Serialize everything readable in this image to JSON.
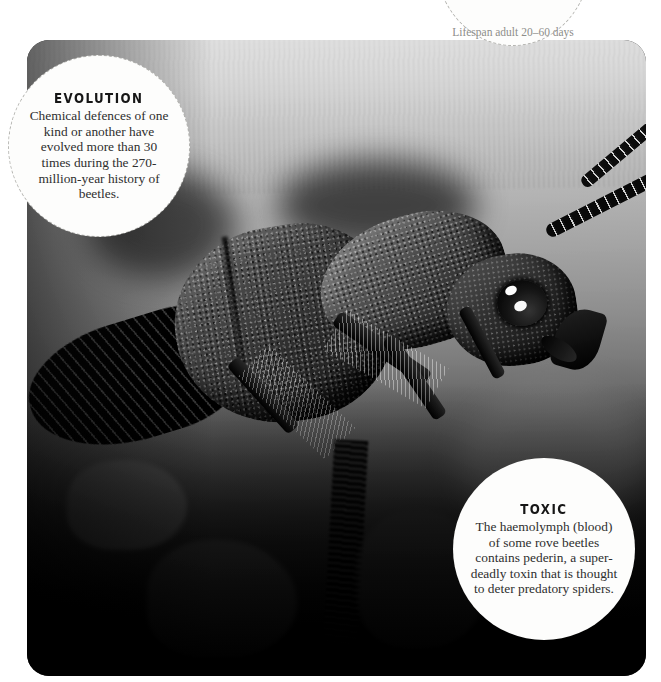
{
  "page": {
    "width": 661,
    "height": 682,
    "background_color": "#ffffff"
  },
  "photo": {
    "subject": "rove-beetle-macro-photograph",
    "treatment": "black-and-white",
    "corner_radius_px": 22
  },
  "facts": {
    "evolution": {
      "heading": "EVOLUTION",
      "body": "Chemical defences of one kind or another have evolved more than 30 times during the 270-million-year history of beetles.",
      "border_style": "dashed",
      "border_color": "#b4b4b0",
      "background_color": "#fdfdfc"
    },
    "toxic": {
      "heading": "TOXIC",
      "body": "The haemolymph (blood) of some rove beetles contains pederin, a super-deadly toxin that is thought to deter predatory spiders.",
      "border_style": "none",
      "background_color": "#fdfdfc"
    },
    "lifespan": {
      "heading": "",
      "body": "Lifespan adult 20–60 days",
      "border_style": "dashed",
      "border_color": "#b4b4b0",
      "background_color": "#fdfdfc",
      "clipped": "top"
    }
  }
}
